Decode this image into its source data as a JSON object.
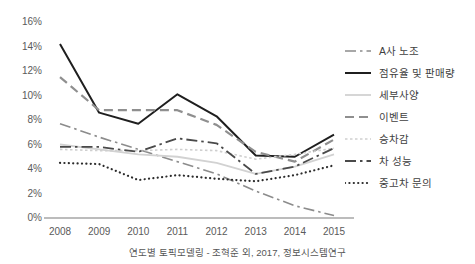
{
  "chart_data": {
    "type": "line",
    "title": "",
    "xlabel": "",
    "ylabel": "",
    "categories": [
      "2008",
      "2009",
      "2010",
      "2011",
      "2012",
      "2013",
      "2014",
      "2015"
    ],
    "x": [
      2008,
      2009,
      2010,
      2011,
      2012,
      2013,
      2014,
      2015
    ],
    "ylim": [
      0,
      16
    ],
    "yticks": [
      0,
      2,
      4,
      6,
      8,
      10,
      12,
      14,
      16
    ],
    "ytick_labels": [
      "0%",
      "2%",
      "4%",
      "6%",
      "8%",
      "10%",
      "12%",
      "14%",
      "16%"
    ],
    "ytick_format": "percent",
    "grid": false,
    "legend_position": "right",
    "series": [
      {
        "name": "A사 노조",
        "values": [
          7.7,
          6.6,
          5.6,
          4.6,
          3.6,
          2.2,
          1.0,
          0.2
        ],
        "color": "#8c8c8c",
        "style": "dashdot",
        "width": 1.6
      },
      {
        "name": "점유율 및 판매량",
        "values": [
          14.2,
          8.6,
          7.7,
          10.1,
          8.3,
          5.1,
          5.0,
          6.8
        ],
        "color": "#1f1f1f",
        "style": "solid",
        "width": 2.0
      },
      {
        "name": "세부사양",
        "values": [
          6.0,
          5.6,
          5.2,
          5.0,
          4.5,
          3.6,
          4.2,
          5.2
        ],
        "color": "#d2d2d2",
        "style": "solid",
        "width": 1.8
      },
      {
        "name": "이벤트",
        "values": [
          11.5,
          8.8,
          8.8,
          8.8,
          7.6,
          5.4,
          4.6,
          6.4
        ],
        "color": "#8f8f8f",
        "style": "dashed",
        "width": 2.2
      },
      {
        "name": "승차감",
        "values": [
          5.6,
          5.5,
          5.5,
          5.6,
          5.5,
          4.8,
          5.2,
          5.7
        ],
        "color": "#cfcfcf",
        "style": "dotted-fine",
        "width": 1.6
      },
      {
        "name": "차 성능",
        "values": [
          5.8,
          5.8,
          5.4,
          6.5,
          6.1,
          3.6,
          4.2,
          5.7
        ],
        "color": "#4a4a4a",
        "style": "dashdot",
        "width": 1.8
      },
      {
        "name": "중고차 문의",
        "values": [
          4.5,
          4.4,
          3.1,
          3.5,
          3.2,
          3.0,
          3.5,
          4.3
        ],
        "color": "#2b2b2b",
        "style": "dotted",
        "width": 2.2
      }
    ]
  },
  "axis": {
    "axis_line_color": "#a6a6a6",
    "tick_text_color": "#5a5a5a"
  },
  "caption": {
    "text": "연도별 토픽모델링 - 조혁준 외, 2017, 정보시스템연구"
  }
}
